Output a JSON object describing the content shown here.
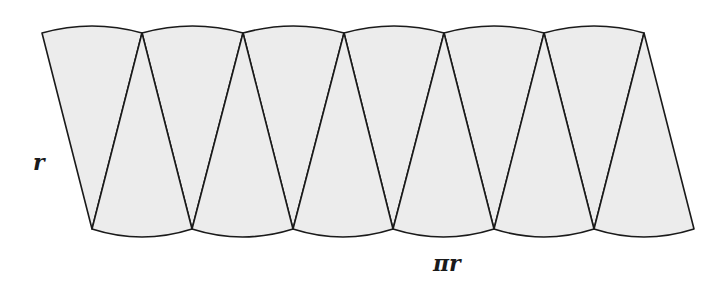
{
  "diagram": {
    "sector_count": 12,
    "fill_color": "#ececec",
    "stroke_color": "#1a1a1a",
    "top_vertices_x": [
      42,
      142,
      243,
      344,
      444,
      544,
      644
    ],
    "top_y": 33,
    "top_arc_peak_y": 26,
    "bottom_vertices_x": [
      92,
      192,
      293,
      393,
      494,
      594,
      694
    ],
    "bottom_y": 229,
    "bottom_arc_low_y": 237
  },
  "labels": {
    "side": "r",
    "base": "πr"
  }
}
